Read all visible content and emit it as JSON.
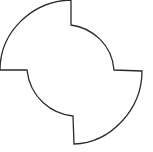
{
  "figure": {
    "shape_name": "pinwheel-quadrant-shape",
    "stroke_color": "#2a2a2a",
    "fill_color": "#ffffff",
    "background": "#ffffff"
  }
}
